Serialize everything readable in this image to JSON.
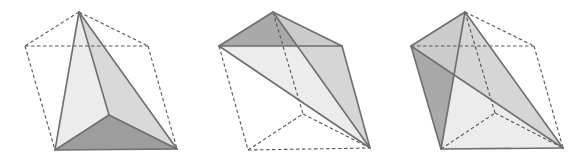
{
  "diagram": {
    "colors": {
      "background": "#ffffff",
      "solid_edge": "#6e6e6e",
      "dashed_edge": "#555555",
      "face_light": "#e9e9e9",
      "face_mid": "#d2d2d2",
      "face_dark": "#9a9a9a",
      "face_darker": "#8c8c8c"
    },
    "figures": [
      {
        "id": "figure-1",
        "vertices": {
          "A": [
            79,
            12
          ],
          "L": [
            25,
            46
          ],
          "R": [
            148,
            46
          ],
          "BL": [
            55,
            150
          ],
          "BR": [
            177,
            149
          ],
          "M": [
            109,
            115
          ]
        },
        "faces": [
          {
            "points": [
              "A",
              "BL",
              "M"
            ],
            "fill": "face_light"
          },
          {
            "points": [
              "A",
              "M",
              "BR"
            ],
            "fill": "face_mid"
          },
          {
            "points": [
              "BL",
              "M",
              "BR"
            ],
            "fill": "face_darker"
          }
        ],
        "solid_edges": [
          [
            "A",
            "BL"
          ],
          [
            "A",
            "M"
          ],
          [
            "A",
            "BR"
          ],
          [
            "BL",
            "M"
          ],
          [
            "M",
            "BR"
          ],
          [
            "BL",
            "BR"
          ]
        ],
        "dashed_edges": [
          [
            "A",
            "L"
          ],
          [
            "A",
            "R"
          ],
          [
            "L",
            "R"
          ],
          [
            "L",
            "BL"
          ],
          [
            "R",
            "BR"
          ]
        ]
      },
      {
        "id": "figure-2",
        "vertices": {
          "A": [
            273,
            12
          ],
          "L": [
            219,
            46
          ],
          "R": [
            342,
            46
          ],
          "BL": [
            248,
            150
          ],
          "BR": [
            370,
            148
          ],
          "M": [
            303,
            114
          ]
        },
        "faces": [
          {
            "points": [
              "L",
              "R",
              "BR"
            ],
            "fill": "face_light"
          },
          {
            "points": [
              "A",
              "L",
              "R"
            ],
            "fill": "face_dark"
          },
          {
            "points": [
              "A",
              "R",
              "BR"
            ],
            "fill": "face_mid"
          }
        ],
        "solid_edges": [
          [
            "A",
            "L"
          ],
          [
            "A",
            "R"
          ],
          [
            "L",
            "R"
          ],
          [
            "L",
            "BR"
          ],
          [
            "R",
            "BR"
          ],
          [
            "A",
            "BR"
          ]
        ],
        "dashed_edges": [
          [
            "A",
            "M"
          ],
          [
            "L",
            "BL"
          ],
          [
            "BL",
            "BR"
          ],
          [
            "BL",
            "M"
          ],
          [
            "M",
            "BR"
          ]
        ]
      },
      {
        "id": "figure-3",
        "vertices": {
          "A": [
            465,
            12
          ],
          "L": [
            411,
            46
          ],
          "R": [
            534,
            46
          ],
          "BL": [
            441,
            149
          ],
          "BR": [
            563,
            148
          ],
          "M": [
            495,
            113
          ]
        },
        "faces": [
          {
            "points": [
              "A",
              "BL",
              "BR"
            ],
            "fill": "face_light"
          },
          {
            "points": [
              "A",
              "L",
              "BL"
            ],
            "fill": "face_dark"
          },
          {
            "points": [
              "A",
              "L",
              "BR"
            ],
            "fill": "face_mid"
          }
        ],
        "solid_edges": [
          [
            "A",
            "L"
          ],
          [
            "A",
            "BL"
          ],
          [
            "A",
            "BR"
          ],
          [
            "L",
            "BL"
          ],
          [
            "L",
            "BR"
          ],
          [
            "BL",
            "BR"
          ]
        ],
        "dashed_edges": [
          [
            "A",
            "R"
          ],
          [
            "L",
            "R"
          ],
          [
            "R",
            "BR"
          ],
          [
            "A",
            "M"
          ],
          [
            "BL",
            "M"
          ],
          [
            "M",
            "BR"
          ]
        ]
      }
    ]
  }
}
